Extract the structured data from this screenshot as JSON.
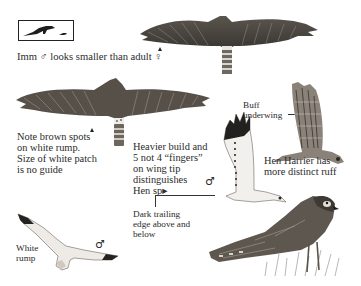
{
  "scale_box": {
    "label": "size-comparison",
    "icon": "crow-and-small-bird-silhouettes"
  },
  "captions": {
    "imm_male": "Imm ♂ looks smaller than adult ♀",
    "rump_note": [
      "Note brown spots",
      "on white rump.",
      "Size of white patch",
      "is no guide"
    ],
    "buff_underwing": [
      "Buff",
      "underwing"
    ],
    "heavier_build": [
      "Heavier build and",
      "5 not 4 “fingers”",
      "on wing tip",
      "distinguishes",
      "Hen sp▸"
    ],
    "male_symbol_mid": "♂",
    "hen_harrier_ruff": [
      "Hen Harrier has",
      "more distinct ruff"
    ],
    "dark_trailing": [
      "Dark trailing",
      "edge above and",
      "below"
    ],
    "white_rump": [
      "White",
      "rump"
    ],
    "male_symbol_bottom": "♂"
  },
  "colors": {
    "ink": "#2b2b2b",
    "plumage_dark": "#3d3a36",
    "plumage_mid": "#7a736a",
    "plumage_light": "#c9c3b9",
    "paper": "#ffffff"
  }
}
